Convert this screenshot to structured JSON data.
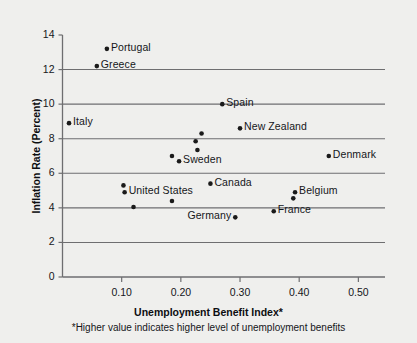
{
  "chart_data": {
    "type": "scatter",
    "title": "",
    "xlabel": "Unemployment Benefit Index*",
    "ylabel": "Inflation Rate (Percent)",
    "footnote": "*Higher value indicates higher level of unemployment benefits",
    "xlim": [
      0.0,
      0.545
    ],
    "ylim": [
      0,
      14
    ],
    "xticks": [
      "0.10",
      "0.20",
      "0.30",
      "0.40",
      "0.50"
    ],
    "xtick_values": [
      0.1,
      0.2,
      0.3,
      0.4,
      0.5
    ],
    "yticks": [
      "0",
      "2",
      "4",
      "6",
      "8",
      "10",
      "12",
      "14"
    ],
    "ytick_values": [
      0,
      2,
      4,
      6,
      8,
      10,
      12,
      14
    ],
    "gridlines_y": [
      2,
      4,
      6,
      8,
      10,
      12
    ],
    "grid": "horizontal",
    "legend": "none",
    "marker_color": "#1a1a1a",
    "axis_color": "#6e6e70",
    "background_color": "#efefed",
    "points": [
      {
        "label": "Portugal",
        "x": 0.075,
        "y": 13.2,
        "label_pos": "right"
      },
      {
        "label": "Greece",
        "x": 0.058,
        "y": 12.2,
        "label_pos": "right"
      },
      {
        "label": "Spain",
        "x": 0.27,
        "y": 10.0,
        "label_pos": "right"
      },
      {
        "label": "Italy",
        "x": 0.011,
        "y": 8.9,
        "label_pos": "right"
      },
      {
        "label": "New Zealand",
        "x": 0.3,
        "y": 8.6,
        "label_pos": "right"
      },
      {
        "label": "",
        "x": 0.235,
        "y": 8.3,
        "label_pos": "none"
      },
      {
        "label": "",
        "x": 0.225,
        "y": 7.85,
        "label_pos": "none"
      },
      {
        "label": "",
        "x": 0.228,
        "y": 7.35,
        "label_pos": "none"
      },
      {
        "label": "",
        "x": 0.185,
        "y": 7.0,
        "label_pos": "none"
      },
      {
        "label": "Sweden",
        "x": 0.197,
        "y": 6.7,
        "label_pos": "right"
      },
      {
        "label": "Denmark",
        "x": 0.45,
        "y": 7.0,
        "label_pos": "right"
      },
      {
        "label": "Canada",
        "x": 0.25,
        "y": 5.4,
        "label_pos": "right"
      },
      {
        "label": "",
        "x": 0.103,
        "y": 5.3,
        "label_pos": "none"
      },
      {
        "label": "United States",
        "x": 0.105,
        "y": 4.9,
        "label_pos": "right"
      },
      {
        "label": "Belgium",
        "x": 0.393,
        "y": 4.9,
        "label_pos": "right"
      },
      {
        "label": "",
        "x": 0.39,
        "y": 4.55,
        "label_pos": "none"
      },
      {
        "label": "",
        "x": 0.185,
        "y": 4.4,
        "label_pos": "none"
      },
      {
        "label": "",
        "x": 0.12,
        "y": 4.05,
        "label_pos": "none"
      },
      {
        "label": "France",
        "x": 0.357,
        "y": 3.8,
        "label_pos": "right"
      },
      {
        "label": "Germany",
        "x": 0.292,
        "y": 3.45,
        "label_pos": "left"
      }
    ]
  },
  "axes": {
    "x_title": "Unemployment Benefit Index*",
    "y_title": "Inflation Rate (Percent)",
    "footnote": "*Higher value indicates higher level of unemployment benefits"
  }
}
